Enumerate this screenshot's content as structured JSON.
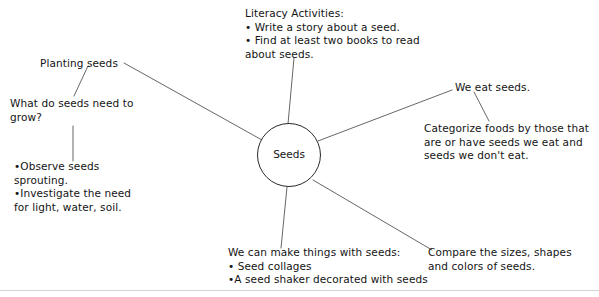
{
  "diagram": {
    "center": {
      "label": "Seeds"
    },
    "nodes": [
      {
        "id": "planting",
        "text": "Planting seeds"
      },
      {
        "id": "need",
        "text": "What do seeds need to grow?"
      },
      {
        "id": "observe",
        "text": "•Observe seeds sprouting.\n•Investigate the need for light, water, soil."
      },
      {
        "id": "literacy",
        "text": "Literacy Activities:\n• Write a story about a seed.\n• Find at least two books to read about seeds."
      },
      {
        "id": "weeat",
        "text": "We eat seeds."
      },
      {
        "id": "categorize",
        "text": "Categorize foods by those that are or have seeds we eat and seeds we don't eat."
      },
      {
        "id": "make",
        "text": "We can make things with seeds:\n• Seed collages\n•A seed shaker decorated with seeds"
      },
      {
        "id": "compare",
        "text": "Compare the sizes, shapes and colors of seeds."
      }
    ],
    "colors": {
      "ink": "#141414",
      "line": "#555555",
      "background": "#ffffff",
      "rule": "#c8c8c8"
    }
  }
}
